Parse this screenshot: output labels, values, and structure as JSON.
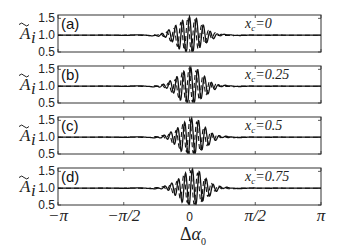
{
  "chart_data": {
    "type": "line",
    "xlabel": "Δα₀",
    "ylabel": "Ã_i",
    "xlim": [
      -3.14159,
      3.14159
    ],
    "ylim": [
      0.5,
      1.6
    ],
    "xticks": [
      "−π",
      "−π/2",
      "0",
      "π/2",
      "π"
    ],
    "yticks": [
      "0.5",
      "1.0",
      "1.5"
    ],
    "grid": false,
    "panels": [
      {
        "label": "(a)",
        "annotation": "x_c=0",
        "xc": 0
      },
      {
        "label": "(b)",
        "annotation": "x_c=0.25",
        "xc": 0.25
      },
      {
        "label": "(c)",
        "annotation": "x_c=0.5",
        "xc": 0.5
      },
      {
        "label": "(d)",
        "annotation": "x_c=0.75",
        "xc": 0.75
      }
    ],
    "series": [
      {
        "name": "solid",
        "style": "solid",
        "description": "Oscillating wave packet centered at Δα₀=0, amplitude ~0.5 around baseline 1.0, decaying to 1.0 beyond |Δα₀|≈π/4"
      },
      {
        "name": "dashed",
        "style": "dashed",
        "description": "Companion oscillation with phase shift, similar envelope, baseline 1.0"
      }
    ]
  },
  "axes": {
    "ytick_labels": [
      "1.5",
      "1.0",
      "0.5"
    ],
    "xtick_labels": [
      "−π",
      "−π/2",
      "0",
      "π/2",
      "π"
    ],
    "xlabel_delta": "Δ",
    "xlabel_alpha": "α",
    "xlabel_sub": "0",
    "ylabel_main": "A",
    "ylabel_sub": "i"
  },
  "panels": [
    {
      "label": "(a)",
      "xc_prefix": "x",
      "xc_sub": "c",
      "xc_value": "=0"
    },
    {
      "label": "(b)",
      "xc_prefix": "x",
      "xc_sub": "c",
      "xc_value": "=0.25"
    },
    {
      "label": "(c)",
      "xc_prefix": "x",
      "xc_sub": "c",
      "xc_value": "=0.5"
    },
    {
      "label": "(d)",
      "xc_prefix": "x",
      "xc_sub": "c",
      "xc_value": "=0.75"
    }
  ]
}
